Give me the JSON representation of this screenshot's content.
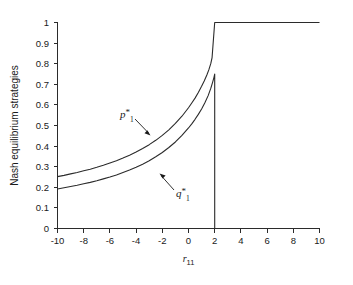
{
  "chart_data": {
    "type": "line",
    "title": "",
    "xlabel": "r_11",
    "xlabel_base": "r",
    "xlabel_sub": "11",
    "ylabel": "Nash equilibrium strategies",
    "xlim": [
      -10,
      10
    ],
    "ylim": [
      0,
      1
    ],
    "grid": false,
    "legend_position": "inline-annotation",
    "x_ticks": [
      -10,
      -8,
      -6,
      -4,
      -2,
      0,
      2,
      4,
      6,
      8,
      10
    ],
    "x_tick_labels": [
      "-10",
      "-8",
      "-6",
      "-4",
      "-2",
      "0",
      "2",
      "4",
      "6",
      "8",
      "10"
    ],
    "y_ticks": [
      0,
      0.1,
      0.2,
      0.3,
      0.4,
      0.5,
      0.6,
      0.7,
      0.8,
      0.9,
      1
    ],
    "y_tick_labels": [
      "0",
      "0.1",
      "0.2",
      "0.3",
      "0.4",
      "0.5",
      "0.6",
      "0.7",
      "0.8",
      "0.9",
      "1"
    ],
    "annotations": [
      {
        "name": "p1-star",
        "text_base": "p",
        "text_sub": "1",
        "text_star": "*",
        "x": -4.6,
        "y": 0.56
      },
      {
        "name": "q1-star",
        "text_base": "q",
        "text_sub": "1",
        "text_star": "*",
        "x": -0.4,
        "y": 0.285
      }
    ],
    "series": [
      {
        "name": "p_1^*",
        "label_base": "p",
        "label_sub": "1",
        "label_star": "*",
        "color": "#2b2b2b",
        "x": [
          -10,
          -9.5,
          -9,
          -8.5,
          -8,
          -7.5,
          -7,
          -6.5,
          -6,
          -5.5,
          -5,
          -4.5,
          -4,
          -3.5,
          -3,
          -2.5,
          -2,
          -1.5,
          -1,
          -0.5,
          0,
          0.25,
          0.5,
          0.75,
          1,
          1.2,
          1.4,
          1.55,
          1.7,
          1.8,
          2,
          3,
          4,
          5,
          6,
          7,
          8,
          9,
          10
        ],
        "y": [
          0.252,
          0.258,
          0.265,
          0.272,
          0.28,
          0.288,
          0.297,
          0.307,
          0.318,
          0.329,
          0.342,
          0.356,
          0.371,
          0.388,
          0.407,
          0.428,
          0.452,
          0.479,
          0.51,
          0.545,
          0.586,
          0.609,
          0.633,
          0.66,
          0.69,
          0.716,
          0.745,
          0.77,
          0.8,
          0.83,
          1.0,
          1.0,
          1.0,
          1.0,
          1.0,
          1.0,
          1.0,
          1.0,
          1.0
        ]
      },
      {
        "name": "q_1^*",
        "label_base": "q",
        "label_sub": "1",
        "label_star": "*",
        "color": "#2b2b2b",
        "x": [
          -10,
          -9.5,
          -9,
          -8.5,
          -8,
          -7.5,
          -7,
          -6.5,
          -6,
          -5.5,
          -5,
          -4.5,
          -4,
          -3.5,
          -3,
          -2.5,
          -2,
          -1.5,
          -1,
          -0.5,
          0,
          0.25,
          0.5,
          0.75,
          1,
          1.25,
          1.5,
          1.7,
          1.85,
          1.95,
          2.0,
          2.0
        ],
        "y": [
          0.192,
          0.198,
          0.204,
          0.21,
          0.217,
          0.224,
          0.232,
          0.241,
          0.25,
          0.26,
          0.272,
          0.284,
          0.297,
          0.312,
          0.329,
          0.348,
          0.369,
          0.393,
          0.42,
          0.452,
          0.488,
          0.508,
          0.53,
          0.554,
          0.58,
          0.61,
          0.645,
          0.68,
          0.712,
          0.735,
          0.75,
          0.0
        ]
      }
    ]
  }
}
